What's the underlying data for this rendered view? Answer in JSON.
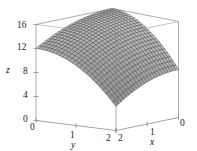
{
  "chart_data": {
    "type": "surface",
    "title": "",
    "xlabel": "x",
    "ylabel": "y",
    "zlabel": "z",
    "xlim": [
      0,
      2
    ],
    "ylim": [
      0,
      2
    ],
    "zlim": [
      0,
      16
    ],
    "x_ticks": [
      "2",
      "1",
      "0"
    ],
    "x_tick_values": [
      2,
      1,
      0
    ],
    "y_ticks": [
      "0",
      "1",
      "2"
    ],
    "y_tick_values": [
      0,
      1,
      2
    ],
    "z_ticks": [
      "0",
      "4",
      "8",
      "12",
      "16"
    ],
    "z_tick_values": [
      0,
      4,
      8,
      12,
      16
    ],
    "grid": false,
    "legend": "none",
    "surface": {
      "expression": "z = 16 - x^2 - 2*y^2 (dome)",
      "mesh": "wireframe",
      "mesh_divisions_x": 24,
      "mesh_divisions_y": 24,
      "color": "#3a3a3a",
      "corner_values": {
        "x0_y0": 16,
        "x2_y0": 12,
        "x0_y2": 8,
        "x2_y2": 2
      },
      "peak_value": 16
    },
    "box": {
      "visible": true,
      "color": "#8a8a8a"
    },
    "view": {
      "azimuth_deg": 45,
      "elevation_deg": 22
    }
  },
  "colors": {
    "background": "#ffffff",
    "axis": "#8a8a8a",
    "text": "#1a1a1a",
    "mesh": "#3a3a3a"
  },
  "axes": {
    "x": {
      "name": "x",
      "ticks": [
        "2",
        "1",
        "0"
      ]
    },
    "y": {
      "name": "y",
      "ticks": [
        "0",
        "1",
        "2"
      ]
    },
    "z": {
      "name": "z",
      "ticks": [
        "16",
        "12",
        "8",
        "4",
        "0"
      ]
    }
  }
}
